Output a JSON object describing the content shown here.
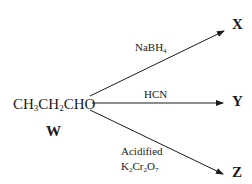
{
  "reactant": {
    "formula_parts": [
      "CH",
      "3",
      "CH",
      "2",
      "CHO"
    ],
    "label": "W"
  },
  "reactions": [
    {
      "reagent": {
        "parts": [
          "NaBH",
          "4"
        ]
      },
      "product": "X"
    },
    {
      "reagent": {
        "text": "HCN"
      },
      "product": "Y"
    },
    {
      "reagent": {
        "line1": "Acidified",
        "line2_parts": [
          "K",
          "2",
          "Cr",
          "2",
          "O",
          "7"
        ]
      },
      "product": "Z"
    }
  ],
  "colors": {
    "ink": "#1a1a1a",
    "background": "#ffffff"
  }
}
